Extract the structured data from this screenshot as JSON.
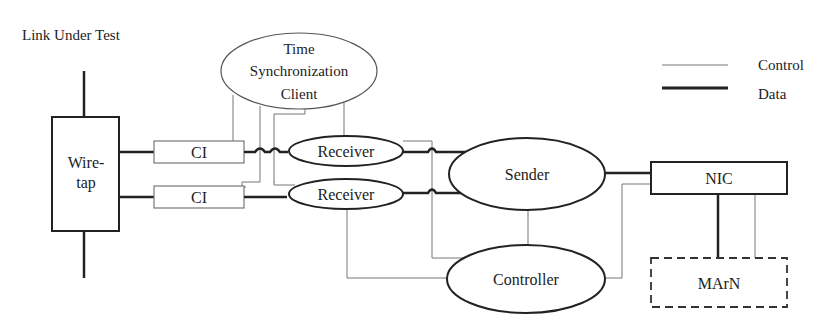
{
  "diagram": {
    "title": "Link Under Test",
    "legend": {
      "control_label": "Control",
      "data_label": "Data"
    },
    "nodes": {
      "wiretap": {
        "line1": "Wire-",
        "line2": "tap"
      },
      "ci_top": "CI",
      "ci_bottom": "CI",
      "time_sync": {
        "line1": "Time",
        "line2": "Synchronization",
        "line3": "Client"
      },
      "receiver_top": "Receiver",
      "receiver_bottom": "Receiver",
      "sender": "Sender",
      "controller": "Controller",
      "nic": "NIC",
      "marn": "MArN"
    },
    "colors": {
      "data_line": "#222222",
      "control_line": "#777777"
    }
  }
}
